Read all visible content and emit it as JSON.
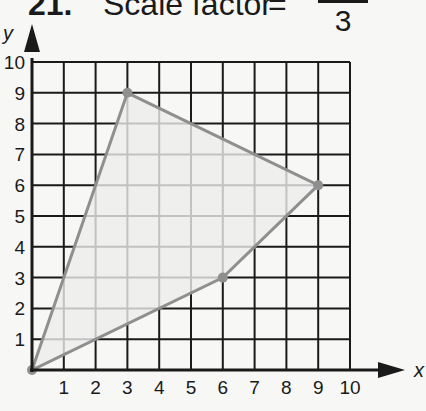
{
  "title": {
    "number": "21.",
    "text": "Scale factor",
    "equals": "=",
    "fraction_denominator": "3"
  },
  "colors": {
    "grid": "#1a1a1a",
    "polygon_stroke": "#8f8f8f",
    "polygon_fill": "#ececec",
    "background": "#f7f7f6"
  },
  "axes": {
    "x_label": "x",
    "y_label": "y",
    "x_ticks": [
      "1",
      "2",
      "3",
      "4",
      "5",
      "6",
      "7",
      "8",
      "9",
      "10"
    ],
    "y_ticks": [
      "1",
      "2",
      "3",
      "4",
      "5",
      "6",
      "7",
      "8",
      "9",
      "10"
    ]
  },
  "chart_data": {
    "type": "scatter",
    "xlabel": "x",
    "ylabel": "y",
    "xlim": [
      0,
      10
    ],
    "ylim": [
      0,
      10
    ],
    "grid": true,
    "polygon": [
      [
        0,
        0
      ],
      [
        3,
        9
      ],
      [
        9,
        6
      ],
      [
        6,
        3
      ]
    ],
    "points": [
      {
        "x": 0,
        "y": 0
      },
      {
        "x": 3,
        "y": 9
      },
      {
        "x": 9,
        "y": 6
      },
      {
        "x": 6,
        "y": 3
      }
    ]
  }
}
